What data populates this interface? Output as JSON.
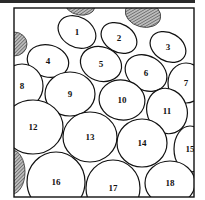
{
  "diagram": {
    "title": "",
    "frame": {
      "x": 14,
      "y": 8,
      "width": 180,
      "height": 189
    },
    "hatch_color": "#555555",
    "hatched_blobs": [
      {
        "name": "top-blob",
        "cx": 80,
        "cy": 5,
        "rx": 15,
        "ry": 10,
        "rot": 10
      },
      {
        "name": "top-right-blob",
        "cx": 143,
        "cy": 14,
        "rx": 18,
        "ry": 13,
        "rot": 15
      },
      {
        "name": "left-top-blob",
        "cx": 14,
        "cy": 44,
        "rx": 13,
        "ry": 12,
        "rot": 0
      },
      {
        "name": "left-bottom-blob",
        "cx": 12,
        "cy": 172,
        "rx": 13,
        "ry": 22,
        "rot": 0
      }
    ],
    "cells": [
      {
        "label": "1",
        "cx": 77,
        "cy": 32,
        "rx": 20,
        "ry": 15,
        "rot": 30
      },
      {
        "label": "2",
        "cx": 119,
        "cy": 38,
        "rx": 19,
        "ry": 14,
        "rot": 30
      },
      {
        "label": "3",
        "cx": 168,
        "cy": 47,
        "rx": 19,
        "ry": 14,
        "rot": 30
      },
      {
        "label": "4",
        "cx": 48,
        "cy": 61,
        "rx": 21,
        "ry": 16,
        "rot": 15
      },
      {
        "label": "5",
        "cx": 101,
        "cy": 64,
        "rx": 21,
        "ry": 17,
        "rot": 20
      },
      {
        "label": "6",
        "cx": 146,
        "cy": 73,
        "rx": 22,
        "ry": 17,
        "rot": 30
      },
      {
        "label": "7",
        "cx": 186,
        "cy": 83,
        "rx": 18,
        "ry": 20,
        "rot": 0
      },
      {
        "label": "8",
        "cx": 22,
        "cy": 86,
        "rx": 21,
        "ry": 22,
        "rot": 0
      },
      {
        "label": "9",
        "cx": 70,
        "cy": 94,
        "rx": 25,
        "ry": 22,
        "rot": 0
      },
      {
        "label": "10",
        "cx": 122,
        "cy": 100,
        "rx": 23,
        "ry": 20,
        "rot": 10
      },
      {
        "label": "11",
        "cx": 167,
        "cy": 111,
        "rx": 20,
        "ry": 23,
        "rot": -20
      },
      {
        "label": "12",
        "cx": 33,
        "cy": 127,
        "rx": 30,
        "ry": 27,
        "rot": 0
      },
      {
        "label": "13",
        "cx": 90,
        "cy": 137,
        "rx": 27,
        "ry": 25,
        "rot": 0
      },
      {
        "label": "14",
        "cx": 142,
        "cy": 143,
        "rx": 25,
        "ry": 24,
        "rot": 0
      },
      {
        "label": "15",
        "cx": 190,
        "cy": 149,
        "rx": 16,
        "ry": 23,
        "rot": 0
      },
      {
        "label": "16",
        "cx": 56,
        "cy": 182,
        "rx": 29,
        "ry": 30,
        "rot": 0
      },
      {
        "label": "17",
        "cx": 113,
        "cy": 188,
        "rx": 27,
        "ry": 28,
        "rot": 0
      },
      {
        "label": "18",
        "cx": 170,
        "cy": 183,
        "rx": 25,
        "ry": 22,
        "rot": 0
      }
    ]
  }
}
